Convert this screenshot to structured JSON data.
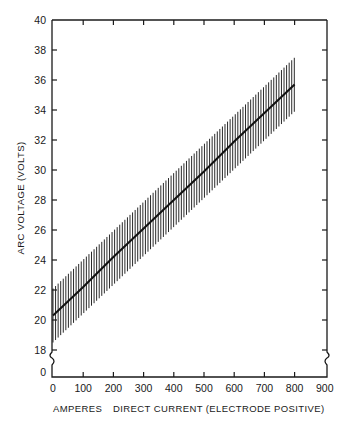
{
  "chart_data": {
    "type": "line",
    "title": "",
    "xlabel": "AMPERES    DIRECT CURRENT (ELECTRODE POSITIVE)",
    "xlabel_left": "AMPERES",
    "xlabel_right": "DIRECT CURRENT (ELECTRODE POSITIVE)",
    "ylabel": "ARC VOLTAGE (VOLTS)",
    "x_ticks": [
      0,
      100,
      200,
      300,
      400,
      500,
      600,
      700,
      800,
      900
    ],
    "y_ticks": [
      0,
      18,
      20,
      22,
      24,
      26,
      28,
      30,
      32,
      34,
      36,
      38,
      40
    ],
    "xlim": [
      0,
      900
    ],
    "ylim": [
      18,
      40
    ],
    "y_axis_break": "between 0 and 18",
    "grid": false,
    "legend": null,
    "series": [
      {
        "name": "Mean arc voltage",
        "x": [
          0,
          100,
          200,
          300,
          400,
          500,
          600,
          700,
          800
        ],
        "y": [
          20.3,
          22.2,
          24.2,
          26.1,
          28.0,
          29.9,
          31.9,
          33.8,
          35.7
        ]
      },
      {
        "name": "Upper bound (hatched band)",
        "x": [
          0,
          800
        ],
        "y": [
          22.1,
          37.5
        ]
      },
      {
        "name": "Lower bound (hatched band)",
        "x": [
          0,
          800
        ],
        "y": [
          18.5,
          33.9
        ]
      }
    ],
    "band_style": "vertical hatching between upper and lower bounds"
  }
}
